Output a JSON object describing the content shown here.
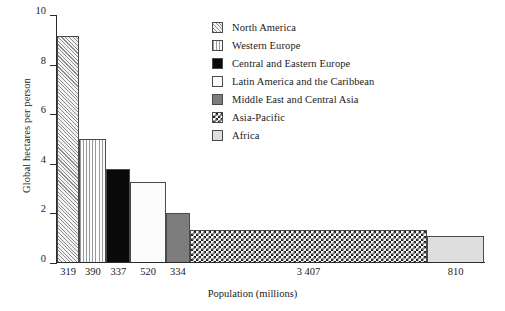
{
  "chart_data": {
    "type": "bar",
    "title": "",
    "xlabel": "Population (millions)",
    "ylabel": "Global hectares per person",
    "ylim": [
      0,
      10
    ],
    "y_ticks": [
      0,
      2,
      4,
      6,
      8,
      10
    ],
    "y_tick_labels": [
      "0",
      "2",
      "4",
      "6",
      "8",
      "10"
    ],
    "grid": false,
    "legend_position": "upper-right-inside",
    "variable_width": true,
    "width_unit": "millions of people",
    "height_unit": "global hectares per person",
    "categories": [
      "North America",
      "Western Europe",
      "Central and Eastern Europe",
      "Latin America and the Caribbean",
      "Middle East and Central Asia",
      "Asia-Pacific",
      "Africa"
    ],
    "values": [
      9.15,
      5.0,
      3.8,
      3.25,
      2.0,
      1.35,
      1.1
    ],
    "widths": [
      319,
      390,
      337,
      520,
      334,
      3407,
      810
    ],
    "x_tick_labels": [
      "319",
      "390",
      "337",
      "520",
      "334",
      "3 407",
      "810"
    ],
    "series": [
      {
        "name": "Global hectares per person",
        "points": [
          {
            "label": "North America",
            "population": 319,
            "value": 9.15,
            "tick": "319",
            "fill": "diagonal-hatch"
          },
          {
            "label": "Western Europe",
            "population": 390,
            "value": 5.0,
            "tick": "390",
            "fill": "vertical-lines"
          },
          {
            "label": "Central and Eastern Europe",
            "population": 337,
            "value": 3.8,
            "tick": "337",
            "fill": "solid-black"
          },
          {
            "label": "Latin America and the Caribbean",
            "population": 520,
            "value": 3.25,
            "tick": "520",
            "fill": "dots"
          },
          {
            "label": "Middle East and Central Asia",
            "population": 334,
            "value": 2.0,
            "tick": "334",
            "fill": "solid-gray"
          },
          {
            "label": "Asia-Pacific",
            "population": 3407,
            "value": 1.35,
            "tick": "3 407",
            "fill": "checkerboard"
          },
          {
            "label": "Africa",
            "population": 810,
            "value": 1.1,
            "tick": "810",
            "fill": "light-gray"
          }
        ]
      }
    ]
  },
  "legend": {
    "items": [
      {
        "label": "North America",
        "fill": "diagonal-hatch"
      },
      {
        "label": "Western Europe",
        "fill": "vertical-lines"
      },
      {
        "label": "Central and Eastern Europe",
        "fill": "solid-black"
      },
      {
        "label": "Latin America and the Caribbean",
        "fill": "dots"
      },
      {
        "label": "Middle East and Central Asia",
        "fill": "solid-gray"
      },
      {
        "label": "Asia-Pacific",
        "fill": "checkerboard"
      },
      {
        "label": "Africa",
        "fill": "light-gray"
      }
    ]
  },
  "colors": {
    "axis": "#2b2b2b",
    "text": "#1a1a1a",
    "bar_border": "#4a4a4a",
    "black_fill": "#0a0a0a",
    "gray_fill": "#7d7d7d",
    "light_gray_fill": "#dedede",
    "background": "#ffffff"
  }
}
